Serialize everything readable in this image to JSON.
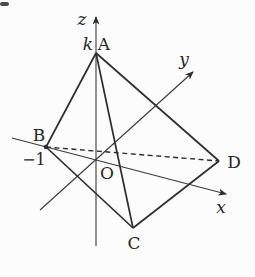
{
  "figure": {
    "type": "3d-coordinate-tetrahedron-diagram",
    "axis_labels": {
      "x": "x",
      "y": "y",
      "z": "z"
    },
    "point_labels": {
      "A": "A",
      "B": "B",
      "C": "C",
      "D": "D",
      "origin": "O"
    },
    "tick_labels": {
      "a_height_on_z": "k",
      "b_position_on_x": "−1"
    },
    "edges": {
      "solid": [
        "A-B",
        "A-C",
        "A-D",
        "B-C",
        "C-D"
      ],
      "dashed": [
        "B-D"
      ]
    },
    "colors": {
      "line": "#2e2e2e",
      "axis": "#3a3a3a",
      "background": "#fcfcfc",
      "text": "#262626"
    }
  }
}
